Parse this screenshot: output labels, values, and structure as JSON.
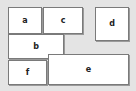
{
  "diagram": {
    "background": "#e4e4e4",
    "box_fill": "#ffffff",
    "box_border": "#7a7a7a",
    "boxes": [
      {
        "id": "a",
        "label": "a",
        "x": 8,
        "y": 7,
        "w": 34,
        "h": 27
      },
      {
        "id": "c",
        "label": "c",
        "x": 43,
        "y": 7,
        "w": 40,
        "h": 27
      },
      {
        "id": "d",
        "label": "d",
        "x": 95,
        "y": 7,
        "w": 34,
        "h": 34
      },
      {
        "id": "b",
        "label": "b",
        "x": 8,
        "y": 34,
        "w": 56,
        "h": 25
      },
      {
        "id": "f",
        "label": "f",
        "x": 8,
        "y": 60,
        "w": 39,
        "h": 25
      },
      {
        "id": "e",
        "label": "e",
        "x": 48,
        "y": 54,
        "w": 81,
        "h": 31
      }
    ]
  }
}
